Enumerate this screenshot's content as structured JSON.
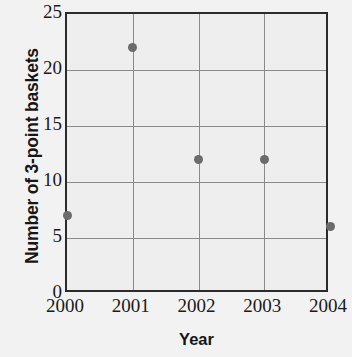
{
  "chart_data": {
    "type": "scatter",
    "title": "",
    "xlabel": "Year",
    "ylabel": "Number of 3-point baskets",
    "x": [
      2000,
      2001,
      2002,
      2003,
      2004
    ],
    "categories": [
      "2000",
      "2001",
      "2002",
      "2003",
      "2004"
    ],
    "values": [
      7,
      22,
      12,
      12,
      6
    ],
    "points": [
      {
        "x": 2000,
        "y": 7
      },
      {
        "x": 2001,
        "y": 22
      },
      {
        "x": 2002,
        "y": 12
      },
      {
        "x": 2003,
        "y": 12
      },
      {
        "x": 2004,
        "y": 6
      }
    ],
    "xlim": [
      2000,
      2004
    ],
    "ylim": [
      0,
      25
    ],
    "xticks": [
      "2000",
      "2001",
      "2002",
      "2003",
      "2004"
    ],
    "yticks": [
      "0",
      "5",
      "10",
      "15",
      "20",
      "25"
    ],
    "ytick_values": [
      0,
      5,
      10,
      15,
      20,
      25
    ],
    "grid": true,
    "legend": "none",
    "colors": {
      "point": "#6b6b6b",
      "axis": "#2b2b2b",
      "grid": "#8a8a8a",
      "background": "#f2f2f2",
      "plot_background": "#eeeeee",
      "text": "#161616"
    }
  },
  "axes": {
    "y_title": "Number of 3-point baskets",
    "x_title": "Year",
    "y_tick_labels": [
      "0",
      "5",
      "10",
      "15",
      "20",
      "25"
    ],
    "x_tick_labels": [
      "2000",
      "2001",
      "2002",
      "2003",
      "2004"
    ]
  }
}
